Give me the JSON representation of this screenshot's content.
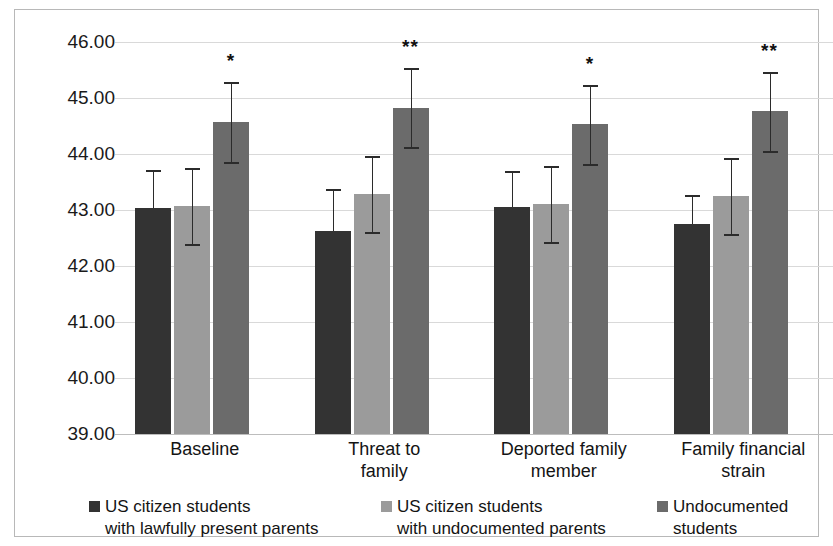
{
  "chart_data": {
    "type": "bar",
    "title": "",
    "xlabel": "",
    "ylabel": "",
    "ylim": [
      39.0,
      46.0
    ],
    "ytick_step": 1.0,
    "ytick_labels": [
      "46.00",
      "45.00",
      "44.00",
      "43.00",
      "42.00",
      "41.00",
      "40.00",
      "39.00"
    ],
    "ytick_values": [
      46.0,
      45.0,
      44.0,
      43.0,
      42.0,
      41.0,
      40.0,
      39.0
    ],
    "grid": true,
    "legend_position": "bottom",
    "categories": [
      "Baseline",
      "Threat to\nfamily",
      "Deported family\nmember",
      "Family financial\nstrain"
    ],
    "series": [
      {
        "name": "US citizen students\nwith lawfully present parents",
        "color": "#333333",
        "values": [
          43.04,
          42.62,
          43.05,
          42.75
        ],
        "err_upper": [
          43.72,
          43.37,
          43.7,
          43.27
        ],
        "err_lower": [
          43.04,
          42.62,
          43.05,
          42.75
        ],
        "significance": [
          "",
          "",
          "",
          ""
        ]
      },
      {
        "name": "US citizen students\nwith undocumented parents",
        "color": "#9b9b9b",
        "values": [
          43.07,
          43.29,
          43.1,
          43.25
        ],
        "err_upper": [
          43.75,
          43.97,
          43.78,
          43.92
        ],
        "err_lower": [
          42.39,
          42.61,
          42.42,
          42.58
        ],
        "significance": [
          "",
          "",
          "",
          ""
        ]
      },
      {
        "name": "Undocumented\nstudents",
        "color": "#6b6b6b",
        "values": [
          44.58,
          44.83,
          44.53,
          44.77
        ],
        "err_upper": [
          45.28,
          45.53,
          45.23,
          45.47
        ],
        "err_lower": [
          43.85,
          44.12,
          43.82,
          44.05
        ],
        "significance": [
          "*",
          "**",
          "*",
          "**"
        ]
      }
    ]
  },
  "axis": {
    "ytick_labels": [
      "46.00",
      "45.00",
      "44.00",
      "43.00",
      "42.00",
      "41.00",
      "40.00",
      "39.00"
    ]
  },
  "legend": {
    "items": [
      {
        "label": "US citizen students\nwith lawfully present parents",
        "color": "#333333"
      },
      {
        "label": "US citizen students\nwith undocumented parents",
        "color": "#9b9b9b"
      },
      {
        "label": "Undocumented\nstudents",
        "color": "#6b6b6b"
      }
    ]
  }
}
